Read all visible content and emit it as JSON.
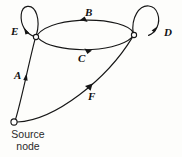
{
  "diagram": {
    "type": "directed-graph",
    "background_color": "#fdfdfb",
    "stroke_color": "#161616",
    "nodes": [
      {
        "id": "source",
        "label_line1": "Source",
        "label_line2": "node",
        "x": 14,
        "y": 122,
        "radius": 3.1,
        "filled": false
      },
      {
        "id": "left",
        "label": "",
        "x": 36,
        "y": 37,
        "radius": 2.6,
        "filled": false
      },
      {
        "id": "right",
        "label": "",
        "x": 134,
        "y": 35,
        "radius": 2.6,
        "filled": false
      }
    ],
    "edges": [
      {
        "id": "A",
        "label": "A",
        "from": "source",
        "to": "left",
        "kind": "arc",
        "label_x": 14,
        "label_y": 70
      },
      {
        "id": "B",
        "label": "B",
        "from": "right",
        "to": "left",
        "kind": "arc",
        "label_x": 85,
        "label_y": 7
      },
      {
        "id": "C",
        "label": "C",
        "from": "left",
        "to": "right",
        "kind": "arc",
        "label_x": 78,
        "label_y": 53
      },
      {
        "id": "D",
        "label": "D",
        "from": "right",
        "to": "right",
        "kind": "self-loop",
        "label_x": 164,
        "label_y": 27
      },
      {
        "id": "E",
        "label": "E",
        "from": "left",
        "to": "left",
        "kind": "self-loop",
        "label_x": 11,
        "label_y": 26
      },
      {
        "id": "F",
        "label": "F",
        "from": "source",
        "to": "right",
        "kind": "arc",
        "label_x": 88,
        "label_y": 91
      }
    ]
  }
}
